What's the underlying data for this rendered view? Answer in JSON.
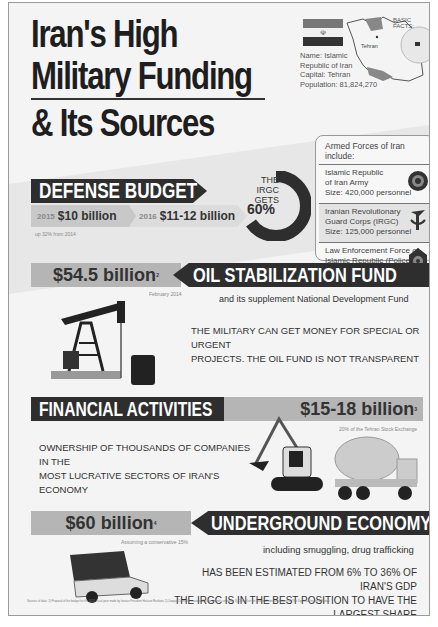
{
  "title": {
    "line1": "Iran's High",
    "line2": "Military  Funding",
    "line3": "& Its Sources"
  },
  "basic_facts": {
    "label": "BASIC FACTS:",
    "city": "Tehran",
    "name": "Name: Islamic",
    "name2": "Republic of Iran",
    "capital": "Capital:  Tehran",
    "population": "Population: 81,824,270",
    "flag_emblem": "☫"
  },
  "armed_forces": {
    "heading": "Armed Forces of Iran include:",
    "items": [
      {
        "line1": "Islamic Republic",
        "line2": "of Iran Army",
        "size": "Size: 420,000 personnel"
      },
      {
        "line1": "Iranian Revolutionary",
        "line2": "Guard Corps (IRGC)",
        "size": "Size: 125,000 personnel"
      },
      {
        "line1": "Law Enforcement Force of",
        "line2": "Islamic Republic (Police)",
        "size": "Size: 500,000 personnel"
      }
    ]
  },
  "defense_budget": {
    "title": "DEFENSE BUDGET",
    "footnote": "1",
    "year1": "2015",
    "value1": "$10 billion",
    "year2": "2016",
    "value2": "$11-12 billion",
    "note": "up 32% from 2014",
    "irgc_label1": "THE IRGC",
    "irgc_label2": "GETS",
    "irgc_pct": "60%"
  },
  "oil_fund": {
    "amount": "$54.5 billion",
    "footnote": "2",
    "title": "OIL STABILIZATION FUND",
    "date": "February 2014",
    "subtitle": "and its supplement National Development Fund",
    "text1": "THE MILITARY CAN GET MONEY FOR SPECIAL OR URGENT",
    "text2": "PROJECTS.  THE OIL FUND IS NOT TRANSPARENT"
  },
  "financial": {
    "title": "FINANCIAL ACTIVITIES",
    "amount": "$15-18 billion",
    "footnote": "3",
    "note": "20% of the Tehran Stock Exchange",
    "text1": "OWNERSHIP OF THOUSANDS OF COMPANIES IN THE",
    "text2": "MOST LUCRATIVE SECTORS OF IRAN'S ECONOMY"
  },
  "underground": {
    "amount": "$60 billion",
    "footnote": "4",
    "title": "UNDERGROUND ECONOMY",
    "note": "Assuming a conservative 15%",
    "subtitle": "including smuggling, drug trafficking",
    "text1": "HAS BEEN ESTIMATED FROM 6% TO 36% OF IRAN'S GDP",
    "text2": "THE IRGC IS IN THE BEST POSITION TO HAVE THE LARGEST SHARE"
  },
  "footer": {
    "sources": "Sources of data: 1) Proposal of the budget for the 2015 fiscal year made by Iranian President Hassan Rouhani; 2) Zawya; Center for sustainable investment's research; 3) Center for the National Interest's Report; 4) The Diplomat Insider's Report"
  },
  "colors": {
    "dark_banner": "#2e2e2e",
    "grey_banner": "#b5b5b5",
    "background": "#f4f4f4"
  }
}
